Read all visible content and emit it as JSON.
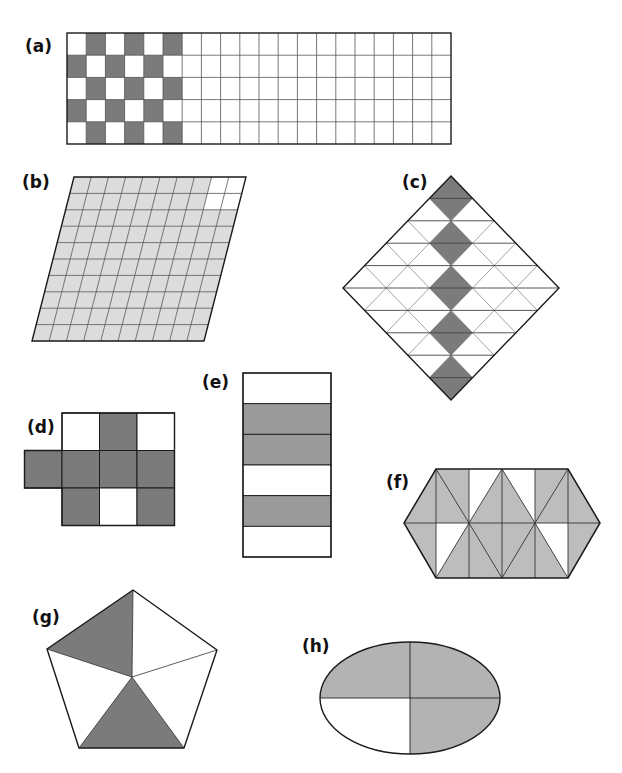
{
  "header": {
    "partial_title": ""
  },
  "colors": {
    "dark": "#7b7b7b",
    "light": "#dcdcdc",
    "mid": "#bdbdbd",
    "ellipse": "#b3b3b3",
    "stroke": "#1a1a1a",
    "gridline": "#555555"
  },
  "figures": [
    {
      "id": "a",
      "label": "(a)",
      "shape": "rectangle grid",
      "rows": 5,
      "cols": 20,
      "shaded_cells": 15,
      "total_cells": 100,
      "pattern": "checkerboard in first 6 columns"
    },
    {
      "id": "b",
      "label": "(b)",
      "shape": "parallelogram grid",
      "rows": 10,
      "cols": 10,
      "shaded_cells": 96,
      "total_cells": 100
    },
    {
      "id": "c",
      "label": "(c)",
      "shape": "diamond of triangles",
      "shaded_pattern": "vertical column of 5 small diamonds along the centre axis"
    },
    {
      "id": "d",
      "label": "(d)",
      "shape": "cross of squares",
      "total_cells": 10,
      "shaded_cells": 7
    },
    {
      "id": "e",
      "label": "(e)",
      "shape": "rectangle strips",
      "strips": 6,
      "shaded_strips": [
        2,
        3,
        5
      ]
    },
    {
      "id": "f",
      "label": "(f)",
      "shape": "hexagon of triangles",
      "white_triangles": 4
    },
    {
      "id": "g",
      "label": "(g)",
      "shape": "pentagon",
      "sections": 5,
      "shaded_sections": 2
    },
    {
      "id": "h",
      "label": "(h)",
      "shape": "ellipse",
      "sections": 4,
      "shaded_sections": 3
    }
  ]
}
